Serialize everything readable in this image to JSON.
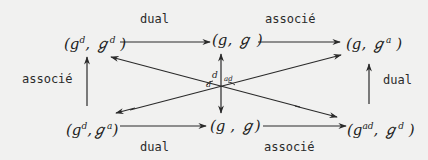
{
  "diagram": {
    "type": "commutative-diagram",
    "background": "#f1f1f0",
    "ink_color": "#2a2a2a",
    "nodes": {
      "top_left": {
        "paren_open": "(",
        "a": "g",
        "a_sup": "d",
        "sep": ",",
        "b": "ℊ",
        "b_sup": "d",
        "paren_close": ")"
      },
      "top_middle": {
        "paren_open": "(",
        "a": "g",
        "a_sup": "",
        "sep": ",",
        "b": "ℊ",
        "b_sup": "",
        "paren_close": ")"
      },
      "top_right": {
        "paren_open": "(",
        "a": "g",
        "a_sup": "",
        "sep": ",",
        "b": "ℊ",
        "b_sup": "a",
        "paren_close": ")"
      },
      "bottom_left": {
        "paren_open": "(",
        "a": "g",
        "a_sup": "d",
        "sep": ",",
        "b": "ℊ",
        "b_sup": "a",
        "paren_close": ")"
      },
      "bottom_middle": {
        "paren_open": "(",
        "a": "g",
        "a_sup": "",
        "sep": ",",
        "b": "ℊ",
        "b_sup": "",
        "paren_close": ")"
      },
      "bottom_right": {
        "paren_open": "(",
        "a": "g",
        "a_sup": "ad",
        "sep": ",",
        "b": "ℊ",
        "b_sup": "d",
        "paren_close": ")"
      }
    },
    "edges": {
      "top_left_arrow_label": "dual",
      "top_right_arrow_label": "associé",
      "left_vertical_label": "associé",
      "right_vertical_label": "dual",
      "bottom_left_arrow_label": "dual",
      "bottom_right_arrow_label": "associé",
      "center_label_main": "d",
      "center_label_sub": "ad",
      "center_label_left": "d"
    }
  }
}
